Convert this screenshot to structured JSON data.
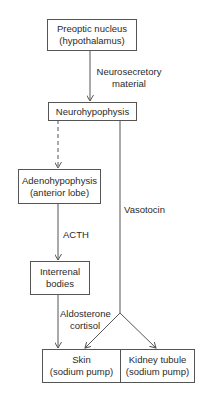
{
  "nodes": {
    "preoptic": {
      "line1": "Preoptic nucleus",
      "line2": "(hypothalamus)"
    },
    "neurohypophysis": {
      "line1": "Neurohypophysis"
    },
    "adenohypophysis": {
      "line1": "Adenohypophysis",
      "line2": "(anterior lobe)"
    },
    "interrenal": {
      "line1": "Interrenal",
      "line2": "bodies"
    },
    "skin": {
      "line1": "Skin",
      "line2": "(sodium pump)"
    },
    "kidney": {
      "line1": "Kidney tubule",
      "line2": "(sodium pump)"
    }
  },
  "edges": {
    "neurosecretory": {
      "line1": "Neurosecretory",
      "line2": "material"
    },
    "vasotocin": {
      "label": "Vasotocin"
    },
    "acth": {
      "label": "ACTH"
    },
    "aldosterone": {
      "line1": "Aldosterone",
      "line2": "cortisol"
    }
  }
}
